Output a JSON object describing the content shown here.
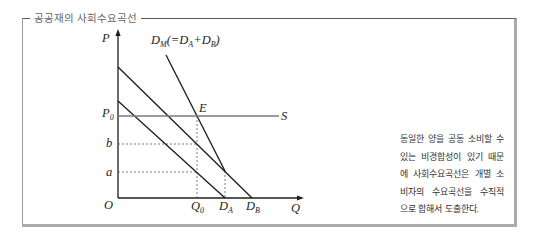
{
  "figure": {
    "title": "공공재의 사회수요곡선"
  },
  "labels": {
    "y_axis": "P",
    "x_axis": "Q",
    "origin": "O",
    "dm": {
      "d1": "D",
      "s1": "M",
      "t2": "(=D",
      "s2": "A",
      "t3": "+D",
      "s3": "B",
      "t4": ")"
    },
    "e": "E",
    "p0": {
      "main": "P",
      "sub": "0"
    },
    "s": "S",
    "b": "b",
    "a": "a",
    "q0": {
      "main": "Q",
      "sub": "0"
    },
    "da": {
      "main": "D",
      "sub": "A"
    },
    "db": {
      "main": "D",
      "sub": "B"
    }
  },
  "note": {
    "lines": [
      "동일한 양을 공동 소비할 수",
      "있는 비경합성이 있기 때문",
      "에 사회수요곡선은 개별 소",
      "비자의 수요곡선을 수직적",
      "으로 합해서 도출한다."
    ]
  },
  "chart_data": {
    "type": "line",
    "title": "공공재의 사회수요곡선",
    "xlabel": "Q",
    "ylabel": "P",
    "xlim": [
      0,
      186
    ],
    "ylim": [
      0,
      169
    ],
    "grid": false,
    "legend": "inline labels",
    "series": [
      {
        "name": "D_A",
        "points": [
          [
            0,
            97
          ],
          [
            107,
            0
          ]
        ],
        "style": "solid"
      },
      {
        "name": "D_B",
        "points": [
          [
            0,
            131
          ],
          [
            134,
            0
          ]
        ],
        "style": "solid"
      },
      {
        "name": "D_M (=D_A+D_B)",
        "points": [
          [
            48,
            143
          ],
          [
            107,
            27
          ]
        ],
        "style": "solid"
      },
      {
        "name": "S",
        "points": [
          [
            0,
            82
          ],
          [
            161,
            82
          ]
        ],
        "style": "gray"
      }
    ],
    "guides": [
      {
        "label": "b",
        "points": [
          [
            0,
            54
          ],
          [
            79,
            54
          ]
        ]
      },
      {
        "label": "a",
        "points": [
          [
            0,
            26
          ],
          [
            79,
            26
          ]
        ]
      },
      {
        "label": "Q_0",
        "points": [
          [
            79,
            82
          ],
          [
            79,
            0
          ]
        ]
      },
      {
        "label": "D_A",
        "points": [
          [
            107,
            27
          ],
          [
            107,
            0
          ]
        ]
      }
    ],
    "annotations": {
      "E": [
        79,
        82
      ],
      "P_0": 82,
      "b": 54,
      "a": 26,
      "Q_0": 79,
      "D_A": 107,
      "D_B": 134
    }
  }
}
